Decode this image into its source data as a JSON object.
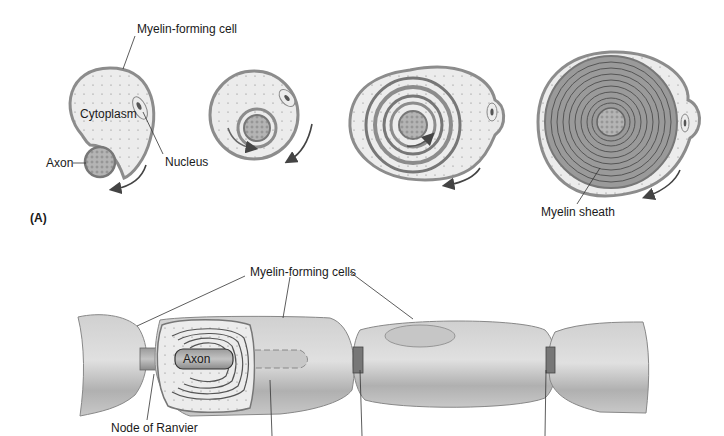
{
  "panel_a": {
    "panel_label": "(A)",
    "labels": {
      "myelin_forming_cell": "Myelin-forming cell",
      "cytoplasm": "Cytoplasm",
      "axon": "Axon",
      "nucleus": "Nucleus",
      "myelin_sheath": "Myelin sheath"
    },
    "stages": 4
  },
  "panel_b": {
    "labels": {
      "myelin_forming_cells": "Myelin-forming cells",
      "axon": "Axon",
      "node_of_ranvier": "Node of Ranvier"
    }
  },
  "colors": {
    "membrane": "#8c8c8c",
    "cytoplasm": "#ececec",
    "myelin": "#9a9a9a",
    "axon": "#b8b8b8",
    "sheath_light": "#d4d4d4",
    "sheath_dark": "#a6a6a6",
    "line": "#333333"
  }
}
